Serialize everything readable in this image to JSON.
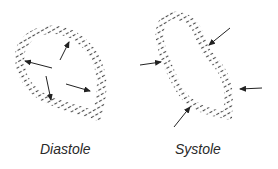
{
  "diagram": {
    "panels": [
      {
        "label": "Diastole",
        "shape": "teardrop-ventricle-outline",
        "arrow_direction": "outward",
        "arrow_count": 4
      },
      {
        "label": "Systole",
        "shape": "contracted-ventricle-outline",
        "arrow_direction": "inward",
        "arrow_count": 4
      }
    ],
    "colors": {
      "stroke": "#333333",
      "hatch": "#555555",
      "background": "#ffffff"
    }
  }
}
